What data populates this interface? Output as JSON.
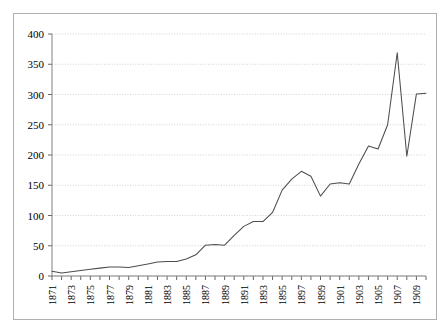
{
  "chart_data": {
    "type": "line",
    "title": "",
    "subtitle": "",
    "xlabel": "",
    "ylabel": "",
    "legend": [],
    "legend_position": "none",
    "grid": true,
    "grid_axis": "y",
    "xlim": [
      1871,
      1910
    ],
    "ylim": [
      0,
      400
    ],
    "y_ticks": [
      0,
      50,
      100,
      150,
      200,
      250,
      300,
      350,
      400
    ],
    "y_tick_labels": [
      "0",
      "50",
      "100",
      "150",
      "200",
      "250",
      "300",
      "350",
      "400"
    ],
    "x_tick_labels": [
      "1871",
      "1873",
      "1875",
      "1877",
      "1879",
      "1881",
      "1883",
      "1885",
      "1887",
      "1889",
      "1891",
      "1893",
      "1895",
      "1897",
      "1899",
      "1901",
      "1903",
      "1905",
      "1907",
      "1909"
    ],
    "x_tick_label_rotation": 90,
    "x_tick_label_interval": 2,
    "x": [
      1871,
      1872,
      1873,
      1874,
      1875,
      1876,
      1877,
      1878,
      1879,
      1880,
      1881,
      1882,
      1883,
      1884,
      1885,
      1886,
      1887,
      1888,
      1889,
      1890,
      1891,
      1892,
      1893,
      1894,
      1895,
      1896,
      1897,
      1898,
      1899,
      1900,
      1901,
      1902,
      1903,
      1904,
      1905,
      1906,
      1907,
      1908,
      1909,
      1910
    ],
    "values": [
      8,
      5,
      7,
      9,
      11,
      13,
      15,
      15,
      14,
      17,
      20,
      23,
      24,
      24,
      28,
      35,
      51,
      52,
      51,
      67,
      82,
      90,
      90,
      105,
      142,
      160,
      173,
      165,
      132,
      152,
      154,
      152,
      185,
      215,
      210,
      250,
      369,
      198,
      301,
      302
    ],
    "series": [
      {
        "name": "series-1",
        "color": "#4d4d4d",
        "points": [
          {
            "x": 1871,
            "y": 8
          },
          {
            "x": 1872,
            "y": 5
          },
          {
            "x": 1873,
            "y": 7
          },
          {
            "x": 1874,
            "y": 9
          },
          {
            "x": 1875,
            "y": 12
          },
          {
            "x": 1876,
            "y": 14
          },
          {
            "x": 1877,
            "y": 15
          },
          {
            "x": 1878,
            "y": 15
          },
          {
            "x": 1879,
            "y": 14
          },
          {
            "x": 1880,
            "y": 17
          },
          {
            "x": 1881,
            "y": 20
          },
          {
            "x": 1882,
            "y": 23
          },
          {
            "x": 1883,
            "y": 24
          },
          {
            "x": 1884,
            "y": 24
          },
          {
            "x": 1885,
            "y": 29
          },
          {
            "x": 1886,
            "y": 35
          },
          {
            "x": 1887,
            "y": 51
          },
          {
            "x": 1888,
            "y": 52
          },
          {
            "x": 1889,
            "y": 51
          },
          {
            "x": 1890,
            "y": 68
          },
          {
            "x": 1891,
            "y": 82
          },
          {
            "x": 1892,
            "y": 90
          },
          {
            "x": 1893,
            "y": 90
          },
          {
            "x": 1894,
            "y": 105
          },
          {
            "x": 1895,
            "y": 142
          },
          {
            "x": 1896,
            "y": 160
          },
          {
            "x": 1897,
            "y": 173
          },
          {
            "x": 1898,
            "y": 165
          },
          {
            "x": 1899,
            "y": 132
          },
          {
            "x": 1900,
            "y": 152
          },
          {
            "x": 1901,
            "y": 154
          },
          {
            "x": 1902,
            "y": 152
          },
          {
            "x": 1903,
            "y": 185
          },
          {
            "x": 1904,
            "y": 215
          },
          {
            "x": 1905,
            "y": 210
          },
          {
            "x": 1906,
            "y": 250
          },
          {
            "x": 1907,
            "y": 369
          },
          {
            "x": 1908,
            "y": 198
          },
          {
            "x": 1909,
            "y": 301
          },
          {
            "x": 1910,
            "y": 302
          }
        ]
      }
    ],
    "extra_points": [
      {
        "y": 302
      },
      {
        "y": 366
      },
      {
        "y": 304
      },
      {
        "y": 338
      },
      {
        "y": 340
      },
      {
        "y": 338
      },
      {
        "y": 243
      },
      {
        "y": 320
      },
      {
        "y": 305
      }
    ],
    "notes": {
      "peak_value": 369,
      "peak_year": 1899,
      "min_value": 5,
      "min_year": 1872
    }
  },
  "figure": {
    "axis_color": "#808080",
    "grid_color": "#c8c8c8",
    "line_color": "#4d4d4d",
    "border_color": "#b0b0b0",
    "background": "#ffffff"
  }
}
